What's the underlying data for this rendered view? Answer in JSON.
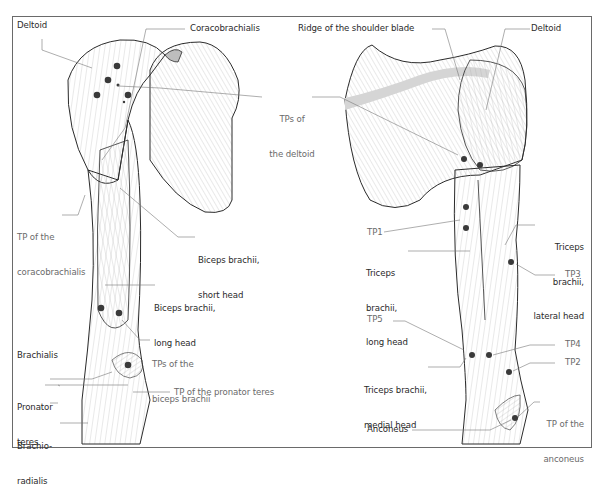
{
  "figure": {
    "left_panel": {
      "view": "anterior arm",
      "labels": {
        "deltoid": "Deltoid",
        "coracobrachialis": "Coracobrachialis",
        "tps_deltoid_line1": "TPs of",
        "tps_deltoid_line2": "the deltoid",
        "tp_coracobrachialis_line1": "TP of the",
        "tp_coracobrachialis_line2": "coracobrachialis",
        "biceps_short_line1": "Biceps brachii,",
        "biceps_short_line2": "short head",
        "biceps_long_line1": "Biceps brachii,",
        "biceps_long_line2": "long head",
        "brachialis": "Brachialis",
        "tps_biceps_line1": "TPs of the",
        "tps_biceps_line2": "biceps brachii",
        "pronator_line1": "Pronator",
        "pronator_line2": "teres",
        "tp_pronator": "TP of the pronator teres",
        "brachioradialis_line1": "Brachio-",
        "brachioradialis_line2": "radialis"
      }
    },
    "right_panel": {
      "view": "posterior arm",
      "labels": {
        "ridge": "Ridge of the shoulder blade",
        "deltoid": "Deltoid",
        "tp1": "TP1",
        "triceps_long_line1": "Triceps",
        "triceps_long_line2": "brachii,",
        "triceps_long_line3": "long head",
        "triceps_lateral_line1": "Triceps",
        "triceps_lateral_line2": "brachii,",
        "triceps_lateral_line3": "lateral head",
        "tp3": "TP3",
        "tp5": "TP5",
        "tp4": "TP4",
        "tp2": "TP2",
        "triceps_medial_line1": "Triceps brachii,",
        "triceps_medial_line2": "medial head",
        "tp_anconeus_line1": "TP of the",
        "tp_anconeus_line2": "anconeus",
        "anconeus": "Anconeus"
      }
    },
    "colors": {
      "trigger_point": "#3a3a3a",
      "outline": "#2b2b2b",
      "fiber": "#9a9a9a",
      "bone_shade": "#cfcfcf",
      "border": "#6a6a6a"
    },
    "trigger_points_count": {
      "left": 9,
      "right": 9
    }
  }
}
